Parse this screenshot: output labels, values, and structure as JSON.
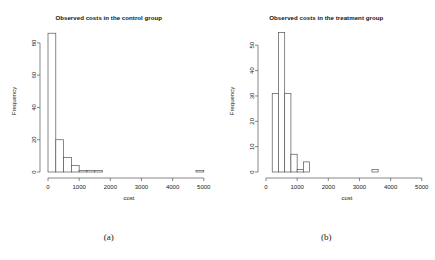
{
  "figure": {
    "background": "#ffffff",
    "axis_color": "#555555",
    "bar_fill": "#ffffff",
    "bar_stroke": "#555555"
  },
  "panels": [
    {
      "caption": "(a)",
      "chart_data": {
        "type": "bar",
        "title": "Observed costs in the control group",
        "xlabel": "cost",
        "ylabel": "Frequency",
        "xlim": [
          0,
          5200
        ],
        "ylim": [
          0,
          88
        ],
        "xticks": [
          0,
          1000,
          2000,
          3000,
          4000,
          5000
        ],
        "xticklabels": [
          "0",
          "1000",
          "2000",
          "3000",
          "4000",
          "5000"
        ],
        "yticks": [
          0,
          20,
          40,
          60,
          80
        ],
        "yticklabels": [
          "0",
          "20",
          "40",
          "60",
          "80"
        ],
        "grid": false,
        "legend": "none",
        "bin_width": 250,
        "bin_starts": [
          0,
          250,
          500,
          750,
          1000,
          1250,
          1500,
          4750
        ],
        "values": [
          86,
          20,
          9,
          4,
          1,
          1,
          1,
          1
        ]
      }
    },
    {
      "caption": "(b)",
      "chart_data": {
        "type": "bar",
        "title": "Observed costs in the treatment group",
        "xlabel": "cost",
        "ylabel": "Frequency",
        "xlim": [
          0,
          5200
        ],
        "ylim": [
          0,
          56
        ],
        "xticks": [
          0,
          1000,
          2000,
          3000,
          4000,
          5000
        ],
        "xticklabels": [
          "0",
          "1000",
          "2000",
          "3000",
          "4000",
          "5000"
        ],
        "yticks": [
          0,
          10,
          20,
          30,
          40,
          50
        ],
        "yticklabels": [
          "0",
          "10",
          "20",
          "30",
          "40",
          "50"
        ],
        "grid": false,
        "legend": "none",
        "bin_width": 200,
        "bin_starts": [
          200,
          400,
          600,
          800,
          1000,
          1200,
          3400
        ],
        "values": [
          31,
          55,
          31,
          7,
          1,
          4,
          1
        ]
      }
    }
  ]
}
